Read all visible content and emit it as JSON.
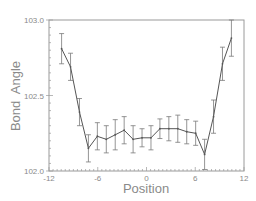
{
  "chart_data": {
    "type": "line",
    "title": "",
    "xlabel": "Position",
    "ylabel": "Bond  Angle",
    "xlim": [
      -12,
      12
    ],
    "ylim": [
      102.0,
      103.0
    ],
    "xticks": [
      -12,
      -6,
      0,
      6,
      12
    ],
    "xtick_labels": [
      "-12",
      "-6",
      "0",
      "6",
      "12"
    ],
    "xminor_step": 0.5,
    "yticks": [
      102.0,
      102.5,
      103.0
    ],
    "ytick_labels": [
      "102.0",
      "102.5",
      "103.0"
    ],
    "yminor_step": 0.05,
    "grid": false,
    "legend": null,
    "error_bars": true,
    "series": [
      {
        "name": "Bond Angle",
        "x": [
          -10.45,
          -9.35,
          -8.25,
          -7.15,
          -6.05,
          -4.95,
          -3.85,
          -2.75,
          -1.65,
          -0.55,
          0.55,
          1.65,
          2.75,
          3.85,
          4.95,
          6.05,
          7.15,
          8.25,
          9.35,
          10.45
        ],
        "y": [
          102.81,
          102.69,
          102.39,
          102.15,
          102.23,
          102.21,
          102.24,
          102.27,
          102.21,
          102.22,
          102.22,
          102.28,
          102.28,
          102.28,
          102.26,
          102.25,
          102.11,
          102.36,
          102.71,
          102.88
        ],
        "err": [
          0.1,
          0.09,
          0.09,
          0.09,
          0.09,
          0.09,
          0.1,
          0.09,
          0.09,
          0.06,
          0.08,
          0.065,
          0.08,
          0.09,
          0.08,
          0.08,
          0.1,
          0.11,
          0.11,
          0.12
        ]
      }
    ]
  },
  "colors": {
    "frame": "#9a9a9a",
    "data_line": "#555555",
    "error_bar": "#7a7a7a",
    "text": "#8a8a8a"
  }
}
